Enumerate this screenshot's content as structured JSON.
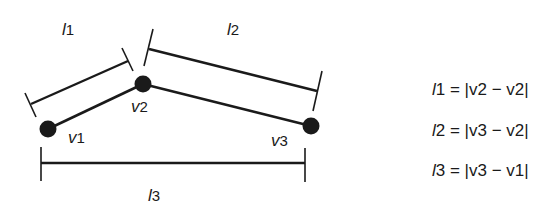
{
  "diagram": {
    "vertices": [
      {
        "id": "v1",
        "label_var": "v",
        "label_sub": "1",
        "x": 48,
        "y": 129
      },
      {
        "id": "v2",
        "label_var": "v",
        "label_sub": "2",
        "x": 143,
        "y": 84
      },
      {
        "id": "v3",
        "label_var": "v",
        "label_sub": "3",
        "x": 311,
        "y": 126
      }
    ],
    "lengths": [
      {
        "id": "l1",
        "var": "l",
        "sub": "1"
      },
      {
        "id": "l2",
        "var": "l",
        "sub": "2"
      },
      {
        "id": "l3",
        "var": "l",
        "sub": "3"
      }
    ],
    "equations": [
      {
        "lhs_var": "l",
        "lhs_sub": "1",
        "text": " = |v2 − v2|"
      },
      {
        "lhs_var": "l",
        "lhs_sub": "2",
        "text": " = |v3 − v2|"
      },
      {
        "lhs_var": "l",
        "lhs_sub": "3",
        "text": " = |v3 − v1|"
      }
    ],
    "colors": {
      "ink": "#1a1a1a",
      "background": "#ffffff"
    }
  }
}
